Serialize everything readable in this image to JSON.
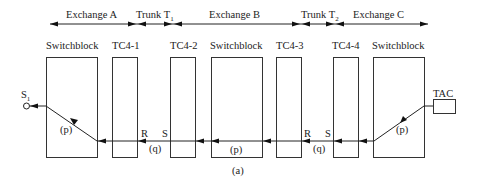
{
  "diagram": {
    "caption": "(a)",
    "spans": [
      {
        "id": "exchange-a",
        "label": "Exchange A"
      },
      {
        "id": "trunk-t1",
        "label": "Trunk T",
        "sub": "1"
      },
      {
        "id": "exchange-b",
        "label": "Exchange B"
      },
      {
        "id": "trunk-t2",
        "label": "Trunk T",
        "sub": "2"
      },
      {
        "id": "exchange-c",
        "label": "Exchange C"
      }
    ],
    "blocks": [
      {
        "id": "switchblock-a",
        "label": "Switchblock"
      },
      {
        "id": "tc4-1",
        "label": "TC4-1"
      },
      {
        "id": "tc4-2",
        "label": "TC4-2"
      },
      {
        "id": "switchblock-b",
        "label": "Switchblock"
      },
      {
        "id": "tc4-3",
        "label": "TC4-3"
      },
      {
        "id": "tc4-4",
        "label": "TC4-4"
      },
      {
        "id": "switchblock-c",
        "label": "Switchblock"
      }
    ],
    "tac": {
      "label": "TAC"
    },
    "subscriber": {
      "label": "S",
      "sub": "1"
    },
    "path_labels": {
      "p_a": "(p)",
      "q_1": "(q)",
      "p_b": "(p)",
      "q_2": "(q)",
      "p_c": "(p)"
    },
    "port_labels": {
      "r1": "R",
      "s1": "S",
      "r2": "R",
      "s2": "S"
    }
  }
}
